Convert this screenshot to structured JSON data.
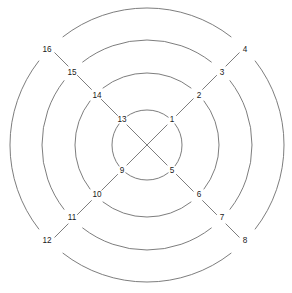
{
  "figure": {
    "background_color": "#ffffff",
    "stroke_color": "#6e6e6e",
    "label_color": "#1a1a1a"
  },
  "chart_data": {
    "type": "diagram",
    "subtype": "concentric-spiral-graph",
    "title": "",
    "xlabel": "",
    "ylabel": "",
    "grid": false,
    "legend": null,
    "geometry": {
      "center": {
        "x": 147,
        "y": 145
      },
      "ring_count": 4,
      "ring_radii": [
        35,
        72,
        105,
        137
      ],
      "node_angles_deg": [
        45,
        315,
        225,
        135
      ],
      "angle_note": "nodes sit on the four diagonal directions; arcs are interrupted at each node",
      "arc_gap_deg": 7
    },
    "nodes": [
      {
        "label": "1",
        "ring": 1,
        "radius": 35,
        "angle_deg": 45,
        "x": 172,
        "y": 120
      },
      {
        "label": "2",
        "ring": 2,
        "radius": 72,
        "angle_deg": 45,
        "x": 199,
        "y": 96
      },
      {
        "label": "3",
        "ring": 3,
        "radius": 105,
        "angle_deg": 45,
        "x": 222,
        "y": 73
      },
      {
        "label": "4",
        "ring": 4,
        "radius": 137,
        "angle_deg": 45,
        "x": 245,
        "y": 50
      },
      {
        "label": "5",
        "ring": 1,
        "radius": 35,
        "angle_deg": 315,
        "x": 172,
        "y": 171
      },
      {
        "label": "6",
        "ring": 2,
        "radius": 72,
        "angle_deg": 315,
        "x": 199,
        "y": 195
      },
      {
        "label": "7",
        "ring": 3,
        "radius": 105,
        "angle_deg": 315,
        "x": 222,
        "y": 218
      },
      {
        "label": "8",
        "ring": 4,
        "radius": 137,
        "angle_deg": 315,
        "x": 245,
        "y": 241
      },
      {
        "label": "9",
        "ring": 1,
        "radius": 35,
        "angle_deg": 225,
        "x": 122,
        "y": 171
      },
      {
        "label": "10",
        "ring": 2,
        "radius": 72,
        "angle_deg": 225,
        "x": 97,
        "y": 195
      },
      {
        "label": "11",
        "ring": 3,
        "radius": 105,
        "angle_deg": 225,
        "x": 72,
        "y": 218
      },
      {
        "label": "12",
        "ring": 4,
        "radius": 137,
        "angle_deg": 225,
        "x": 47,
        "y": 241
      },
      {
        "label": "13",
        "ring": 1,
        "radius": 35,
        "angle_deg": 135,
        "x": 122,
        "y": 120
      },
      {
        "label": "14",
        "ring": 2,
        "radius": 72,
        "angle_deg": 135,
        "x": 97,
        "y": 96
      },
      {
        "label": "15",
        "ring": 3,
        "radius": 105,
        "angle_deg": 135,
        "x": 72,
        "y": 73
      },
      {
        "label": "16",
        "ring": 4,
        "radius": 137,
        "angle_deg": 135,
        "x": 47,
        "y": 50
      }
    ],
    "edges": [
      {
        "from": "1",
        "to": "2",
        "kind": "radial-spiral"
      },
      {
        "from": "2",
        "to": "3",
        "kind": "radial-spiral"
      },
      {
        "from": "3",
        "to": "4",
        "kind": "radial-spiral"
      },
      {
        "from": "4",
        "to": "5",
        "kind": "ring-arc"
      },
      {
        "from": "5",
        "to": "6",
        "kind": "radial-spiral"
      },
      {
        "from": "6",
        "to": "7",
        "kind": "radial-spiral"
      },
      {
        "from": "7",
        "to": "8",
        "kind": "radial-spiral"
      },
      {
        "from": "8",
        "to": "9",
        "kind": "ring-arc"
      },
      {
        "from": "9",
        "to": "10",
        "kind": "radial-spiral"
      },
      {
        "from": "10",
        "to": "11",
        "kind": "radial-spiral"
      },
      {
        "from": "11",
        "to": "12",
        "kind": "radial-spiral"
      },
      {
        "from": "12",
        "to": "13",
        "kind": "ring-arc"
      },
      {
        "from": "13",
        "to": "14",
        "kind": "radial-spiral"
      },
      {
        "from": "14",
        "to": "15",
        "kind": "radial-spiral"
      },
      {
        "from": "15",
        "to": "16",
        "kind": "radial-spiral"
      },
      {
        "from": "1",
        "to": "9",
        "kind": "center-chord"
      },
      {
        "from": "5",
        "to": "13",
        "kind": "center-chord"
      }
    ],
    "arc_segments": [
      {
        "ring": 1,
        "radius": 35,
        "from_angle_deg": 52,
        "to_angle_deg": 128
      },
      {
        "ring": 1,
        "radius": 35,
        "from_angle_deg": 142,
        "to_angle_deg": 218
      },
      {
        "ring": 1,
        "radius": 35,
        "from_angle_deg": 232,
        "to_angle_deg": 308
      },
      {
        "ring": 1,
        "radius": 35,
        "from_angle_deg": 322,
        "to_angle_deg": 38
      },
      {
        "ring": 2,
        "radius": 72,
        "from_angle_deg": 52,
        "to_angle_deg": 128
      },
      {
        "ring": 2,
        "radius": 72,
        "from_angle_deg": 142,
        "to_angle_deg": 218
      },
      {
        "ring": 2,
        "radius": 72,
        "from_angle_deg": 232,
        "to_angle_deg": 308
      },
      {
        "ring": 2,
        "radius": 72,
        "from_angle_deg": 322,
        "to_angle_deg": 38
      },
      {
        "ring": 3,
        "radius": 105,
        "from_angle_deg": 52,
        "to_angle_deg": 128
      },
      {
        "ring": 3,
        "radius": 105,
        "from_angle_deg": 142,
        "to_angle_deg": 218
      },
      {
        "ring": 3,
        "radius": 105,
        "from_angle_deg": 232,
        "to_angle_deg": 308
      },
      {
        "ring": 3,
        "radius": 105,
        "from_angle_deg": 322,
        "to_angle_deg": 38
      },
      {
        "ring": 4,
        "radius": 137,
        "from_angle_deg": 52,
        "to_angle_deg": 128
      },
      {
        "ring": 4,
        "radius": 137,
        "from_angle_deg": 142,
        "to_angle_deg": 218
      },
      {
        "ring": 4,
        "radius": 137,
        "from_angle_deg": 232,
        "to_angle_deg": 308
      },
      {
        "ring": 4,
        "radius": 137,
        "from_angle_deg": 322,
        "to_angle_deg": 38
      }
    ]
  }
}
